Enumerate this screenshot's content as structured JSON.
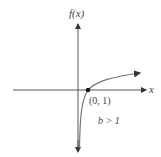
{
  "graph": {
    "y_axis_label": "f(x)",
    "x_axis_label": "x",
    "point_label": "(0, 1)",
    "condition_label": "b > 1",
    "colors": {
      "axes": "#555555",
      "curve": "#777777",
      "point": "#111111",
      "text": "#444444"
    }
  }
}
